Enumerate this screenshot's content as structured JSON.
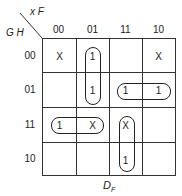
{
  "map": {
    "col_var": "x F",
    "row_var": "G H",
    "col_labels": [
      "00",
      "01",
      "11",
      "10"
    ],
    "row_labels": [
      "00",
      "01",
      "11",
      "10"
    ],
    "cells": [
      [
        "X",
        "1",
        "",
        "X"
      ],
      [
        "",
        "1",
        "1",
        "1"
      ],
      [
        "1",
        "X",
        "X",
        ""
      ],
      [
        "",
        "",
        "1",
        ""
      ]
    ],
    "caption_main": "D",
    "caption_sub": "F"
  }
}
